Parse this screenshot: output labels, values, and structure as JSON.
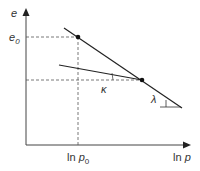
{
  "diagram": {
    "type": "e-ln p consolidation diagram",
    "y_axis": {
      "label": "e"
    },
    "x_axis": {
      "label_prefix": "ln ",
      "label_var": "p"
    },
    "reference": {
      "y_label_var": "e",
      "y_label_sub": "0",
      "x_label_prefix": "ln ",
      "x_label_var": "p",
      "x_label_sub": "0"
    },
    "slopes": {
      "unloading": "κ",
      "normal_compression": "λ"
    },
    "colors": {
      "line": "#222222",
      "axis": "#444444",
      "dash": "#555555"
    }
  }
}
